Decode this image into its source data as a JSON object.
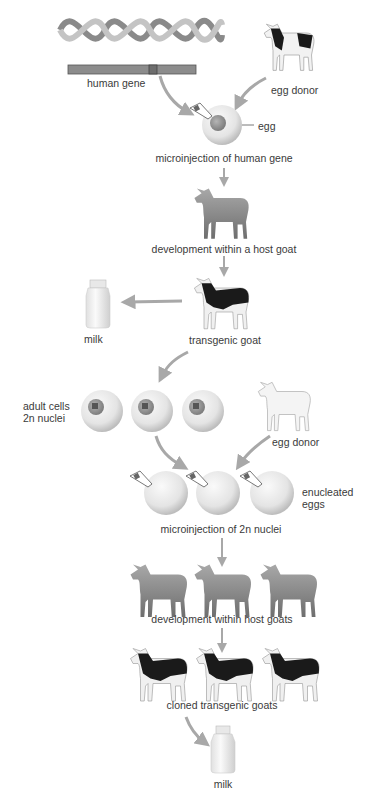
{
  "labels": {
    "human_gene": "human gene",
    "egg_donor_1": "egg donor",
    "egg": "egg",
    "microinjection_human_gene": "microinjection of human gene",
    "development_host_goat": "development within a host goat",
    "milk_1": "milk",
    "transgenic_goat": "transgenic goat",
    "adult_cells_line1": "adult cells",
    "adult_cells_line2": "2n nuclei",
    "egg_donor_2": "egg donor",
    "enucleated_line1": "enucleated",
    "enucleated_line2": "eggs",
    "microinjection_2n": "microinjection of 2n nuclei",
    "development_host_goats": "development within host goats",
    "cloned_transgenic_goats": "cloned transgenic goats",
    "milk_2": "milk"
  },
  "colors": {
    "arrow": "#a8a8a8",
    "goat_gray": "#8a8a8a",
    "goat_black": "#1a1a1a",
    "egg": "#e6e6e6",
    "nucleus": "#9a9a9a",
    "gene_bar": "#8c8c8c"
  }
}
